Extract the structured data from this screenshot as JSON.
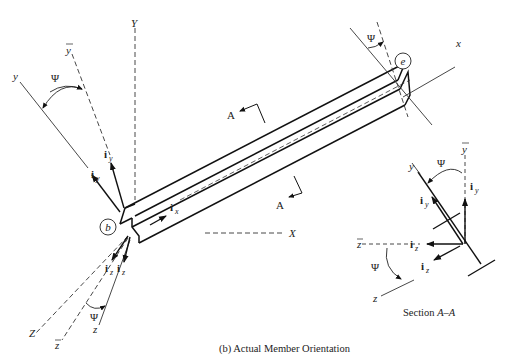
{
  "diagram": {
    "caption": "(b) Actual Member Orientation",
    "section_caption_prefix": "Section ",
    "section_caption_name": "A–A",
    "nodes": {
      "start": "b",
      "end": "e"
    },
    "global_axes": {
      "X": "X",
      "Y": "Y",
      "Z": "Z"
    },
    "local_axes": {
      "x": "x",
      "y": "y",
      "z": "z",
      "ybar": "y",
      "zbar": "z"
    },
    "angle": "Ψ",
    "section_marks": {
      "top": "A",
      "bottom": "A"
    },
    "unit_vectors": {
      "i_prefix": "i",
      "x_sub": "x",
      "y_sub": "y",
      "z_sub": "z",
      "ybar_sub": "y",
      "zbar_sub": "z"
    }
  }
}
